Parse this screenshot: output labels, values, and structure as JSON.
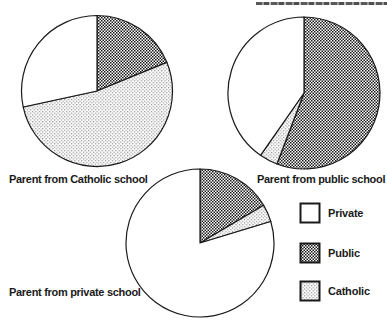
{
  "figure": {
    "background": "#ffffff",
    "ink_color": "#1a1a1a",
    "pattern_colors": {
      "public_crosshatch": "#1a1a1a",
      "catholic_dots": "#8f8f8f"
    }
  },
  "legend": {
    "entries": [
      {
        "label": "Private",
        "swatch": "white"
      },
      {
        "label": "Public",
        "swatch": "dark-crosshatch"
      },
      {
        "label": "Catholic",
        "swatch": "light-dots"
      }
    ]
  },
  "chart_data": [
    {
      "type": "pie",
      "title": "Parent from Catholic school",
      "start_angle_deg": 0,
      "direction": "clockwise",
      "slices": [
        {
          "label": "Public",
          "percent": 18.8,
          "fill": "public"
        },
        {
          "label": "Catholic",
          "percent": 52.8,
          "fill": "catholic"
        },
        {
          "label": "Private",
          "percent": 28.4,
          "fill": "white"
        }
      ]
    },
    {
      "type": "pie",
      "title": "Parent from public school",
      "start_angle_deg": 0,
      "direction": "clockwise",
      "slices": [
        {
          "label": "Public",
          "percent": 55.8,
          "fill": "public"
        },
        {
          "label": "Catholic",
          "percent": 3.9,
          "fill": "catholic"
        },
        {
          "label": "Private",
          "percent": 40.3,
          "fill": "white"
        }
      ]
    },
    {
      "type": "pie",
      "title": "Parent from private school",
      "start_angle_deg": 0,
      "direction": "clockwise",
      "slices": [
        {
          "label": "Public",
          "percent": 16.5,
          "fill": "public"
        },
        {
          "label": "Catholic",
          "percent": 3.8,
          "fill": "catholic"
        },
        {
          "label": "Private",
          "percent": 79.7,
          "fill": "white"
        }
      ]
    }
  ]
}
